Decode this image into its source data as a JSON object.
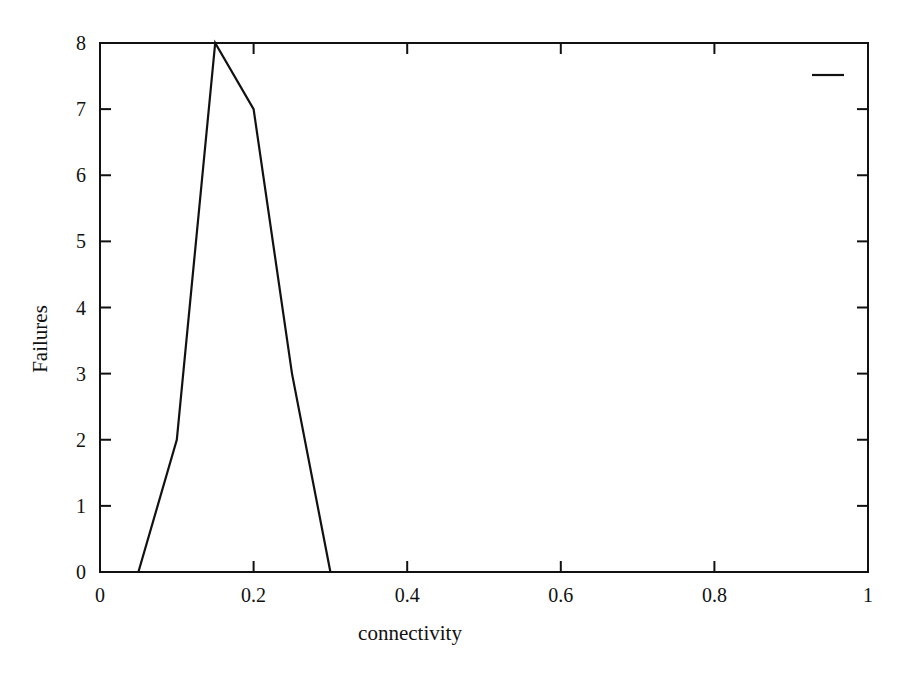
{
  "chart_data": {
    "type": "line",
    "title": "",
    "xlabel": "connectivity",
    "ylabel": "Failures",
    "xlim": [
      0,
      1
    ],
    "ylim": [
      0,
      8
    ],
    "x_ticks": [
      0,
      0.2,
      0.4,
      0.6,
      0.8,
      1
    ],
    "x_tick_labels": [
      "0",
      "0.2",
      "0.4",
      "0.6",
      "0.8",
      "1"
    ],
    "y_ticks": [
      0,
      1,
      2,
      3,
      4,
      5,
      6,
      7,
      8
    ],
    "y_tick_labels": [
      "0",
      "1",
      "2",
      "3",
      "4",
      "5",
      "6",
      "7",
      "8"
    ],
    "grid": false,
    "legend_position": "top-right",
    "series": [
      {
        "name": "",
        "color": "#111111",
        "x": [
          0.05,
          0.1,
          0.15,
          0.2,
          0.25,
          0.3
        ],
        "values": [
          0,
          2,
          8,
          7,
          3,
          0
        ]
      }
    ]
  }
}
